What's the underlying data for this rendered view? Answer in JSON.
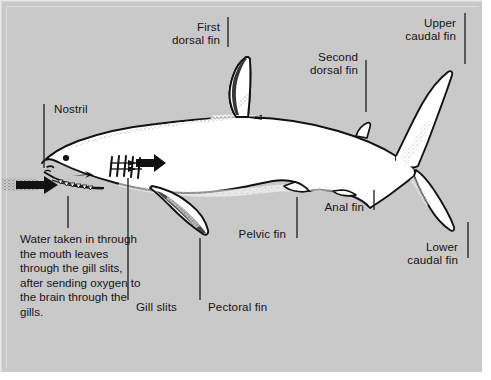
{
  "figure": {
    "background_color": "#c9c9c9",
    "ink_color": "#111111",
    "body_fill": "#ffffff"
  },
  "labels": [
    {
      "id": "nostril",
      "text": "Nostril",
      "align": "left"
    },
    {
      "id": "first-dorsal",
      "text": "First\ndorsal fin",
      "align": "right"
    },
    {
      "id": "second-dorsal",
      "text": "Second\ndorsal fin",
      "align": "right"
    },
    {
      "id": "upper-caudal",
      "text": "Upper\ncaudal fin",
      "align": "right"
    },
    {
      "id": "lower-caudal",
      "text": "Lower\ncaudal fin",
      "align": "right"
    },
    {
      "id": "anal",
      "text": "Anal fin",
      "align": "right"
    },
    {
      "id": "pelvic",
      "text": "Pelvic fin",
      "align": "right"
    },
    {
      "id": "pectoral",
      "text": "Pectoral fin",
      "align": "left"
    },
    {
      "id": "gill-slits",
      "text": "Gill slits",
      "align": "left"
    }
  ],
  "caption": {
    "text": "Water taken in through the mouth leaves through the gill slits, after sending oxygen to the brain through the gills."
  },
  "annotations": {
    "water_in_arrow": "arrow pointing right into the mouth",
    "gill_out_arrow": "arrow pointing right out of the gill slits",
    "gill_slit_count": 5
  }
}
